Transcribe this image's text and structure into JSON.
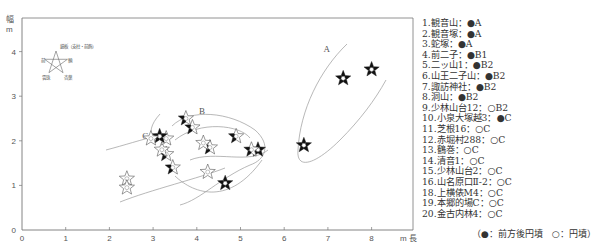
{
  "chart_data": {
    "type": "scatter",
    "title": "",
    "xlabel": "m 長",
    "ylabel": "幅 m",
    "xlim": [
      0,
      8.8
    ],
    "ylim": [
      0,
      4.5
    ],
    "x_ticks": [
      "0",
      "1",
      "2",
      "3",
      "4",
      "5",
      "6",
      "7",
      "8"
    ],
    "y_ticks": [
      "0",
      "1",
      "2",
      "3",
      "4"
    ],
    "grid": false,
    "marker": "pentagram (filled segments indicate present parts)",
    "marker_key": {
      "top": "鏡板（支柱・前飾）",
      "left": "前",
      "right": "輌",
      "bottom_left": "雲珠",
      "bottom_right": "杏葉"
    },
    "groups": [
      {
        "label": "A",
        "label_pos": [
          6.9,
          4.0
        ]
      },
      {
        "label": "B",
        "label_pos": [
          4.05,
          2.6
        ]
      },
      {
        "label": "C",
        "label_pos": [
          2.75,
          2.05
        ]
      }
    ],
    "points": [
      {
        "x": 8.0,
        "y": 3.6,
        "fill": "dark"
      },
      {
        "x": 7.35,
        "y": 3.4,
        "fill": "dark"
      },
      {
        "x": 6.45,
        "y": 1.9,
        "fill": "dark"
      },
      {
        "x": 5.4,
        "y": 1.8,
        "fill": "dark"
      },
      {
        "x": 5.25,
        "y": 1.8,
        "fill": "partial"
      },
      {
        "x": 4.9,
        "y": 2.1,
        "fill": "partial"
      },
      {
        "x": 4.65,
        "y": 1.05,
        "fill": "dark"
      },
      {
        "x": 4.3,
        "y": 1.85,
        "fill": "partial"
      },
      {
        "x": 4.15,
        "y": 1.95,
        "fill": "light"
      },
      {
        "x": 4.25,
        "y": 1.3,
        "fill": "light"
      },
      {
        "x": 3.9,
        "y": 2.3,
        "fill": "partial"
      },
      {
        "x": 3.75,
        "y": 2.5,
        "fill": "partial"
      },
      {
        "x": 3.45,
        "y": 1.4,
        "fill": "partial"
      },
      {
        "x": 3.3,
        "y": 1.7,
        "fill": "partial"
      },
      {
        "x": 3.2,
        "y": 1.8,
        "fill": "light"
      },
      {
        "x": 3.3,
        "y": 2.05,
        "fill": "light"
      },
      {
        "x": 3.15,
        "y": 2.1,
        "fill": "dark"
      },
      {
        "x": 2.95,
        "y": 2.05,
        "fill": "light"
      },
      {
        "x": 2.4,
        "y": 1.15,
        "fill": "light"
      },
      {
        "x": 2.4,
        "y": 0.95,
        "fill": "light"
      }
    ],
    "legend_position": "right",
    "legend": [
      "1.観音山：●A",
      "2.観音塚：●A",
      "3.蛇塚：●A",
      "4.前二子：●B1",
      "5.二ッ山1：●B2",
      "6.山王二子山：●B2",
      "7.諏訪神社：●B2",
      "8.洞山：●B2",
      "9.少林山台12：○B2",
      "10.小泉大塚越3：●C",
      "11.芝根16：○C",
      "12.赤堀村288：○C",
      "13.鶴巻：○C",
      "14.清音1：○C",
      "15.少林山台2：○C",
      "16.山名原口Ⅱ-2：○C",
      "18.上横俵M4：○C",
      "19.本郷的場C：○C",
      "20.金古内林4：○C"
    ],
    "legend_note": "（●：前方後円墳　○：円墳）"
  },
  "legend": {
    "items": [
      "1.観音山：●A",
      "2.観音塚：●A",
      "3.蛇塚：●A",
      "4.前二子：●B1",
      "5.二ッ山1：●B2",
      "6.山王二子山：●B2",
      "7.諏訪神社：●B2",
      "8.洞山：●B2",
      "9.少林山台12：○B2",
      "10.小泉大塚越3：●C",
      "11.芝根16：○C",
      "12.赤堀村288：○C",
      "13.鶴巻：○C",
      "14.清音1：○C",
      "15.少林山台2：○C",
      "16.山名原口Ⅱ-2：○C",
      "18.上横俵M4：○C",
      "19.本郷的場C：○C",
      "20.金古内林4：○C"
    ],
    "note": "（●：前方後円墳　○：円墳）"
  }
}
